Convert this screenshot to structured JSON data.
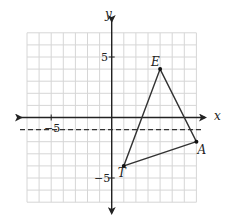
{
  "diagram": {
    "type": "coordinate-plane",
    "axes": {
      "x_label": "x",
      "y_label": "y",
      "range": [
        -7,
        7
      ],
      "grid_step": 1,
      "tick_labels": [
        {
          "axis": "x",
          "value": -5,
          "text": "−5"
        },
        {
          "axis": "y",
          "value": 5,
          "text": "5"
        },
        {
          "axis": "y",
          "value": -5,
          "text": "−5"
        }
      ]
    },
    "triangle": {
      "vertices": [
        {
          "name": "E",
          "x": 4,
          "y": 4
        },
        {
          "name": "A",
          "x": 7,
          "y": -2
        },
        {
          "name": "T",
          "x": 1,
          "y": -4
        }
      ]
    },
    "dashed_line": {
      "equation": "y = -1",
      "y": -1
    },
    "colors": {
      "grid": "#d6d6d6",
      "axis": "#222222",
      "shape": "#333333",
      "background": "#ffffff"
    }
  }
}
